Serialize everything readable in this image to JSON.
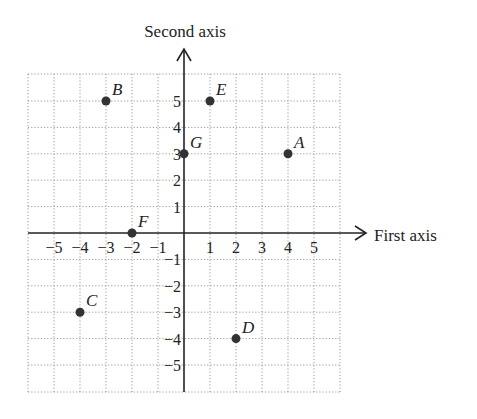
{
  "chart_data": {
    "type": "scatter",
    "title": "",
    "xlabel": "First axis",
    "ylabel": "Second axis",
    "xlim": [
      -6,
      6
    ],
    "ylim": [
      -6,
      6
    ],
    "grid": true,
    "grid_style": "dotted",
    "x_ticks": [
      -5,
      -4,
      -3,
      -2,
      -1,
      1,
      2,
      3,
      4,
      5
    ],
    "y_ticks": [
      5,
      4,
      3,
      2,
      1,
      -1,
      -2,
      -3,
      -4,
      -5
    ],
    "x_tick_labels": [
      "−5",
      "−4",
      "−3",
      "−2",
      "−1",
      "1",
      "2",
      "3",
      "4",
      "5"
    ],
    "y_tick_labels": [
      "5",
      "4",
      "3",
      "2",
      "1",
      "−1",
      "−2",
      "−3",
      "−4",
      "−5"
    ],
    "points": [
      {
        "label": "A",
        "x": 4,
        "y": 3
      },
      {
        "label": "B",
        "x": -3,
        "y": 5
      },
      {
        "label": "C",
        "x": -4,
        "y": -3
      },
      {
        "label": "D",
        "x": 2,
        "y": -4
      },
      {
        "label": "E",
        "x": 1,
        "y": 5
      },
      {
        "label": "F",
        "x": -2,
        "y": 0
      },
      {
        "label": "G",
        "x": 0,
        "y": 3
      }
    ]
  },
  "colors": {
    "axis": "#222222",
    "grid": "#9a9a9a",
    "point": "#333333",
    "text": "#222222"
  }
}
